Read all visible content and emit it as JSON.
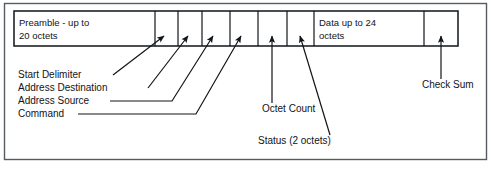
{
  "figure": {
    "background_color": "#ffffff",
    "frame_border_color": "#555b60",
    "line_color": "#111418"
  },
  "frame_bar": {
    "fields": [
      {
        "id": "preamble",
        "label_line1": "Preamble - up to",
        "label_line2": "20 octets",
        "x": 14,
        "width": 141
      },
      {
        "id": "start-delimiter",
        "label_line1": "",
        "label_line2": "",
        "x": 155,
        "width": 23
      },
      {
        "id": "address-destination",
        "label_line1": "",
        "label_line2": "",
        "x": 178,
        "width": 24
      },
      {
        "id": "address-source",
        "label_line1": "",
        "label_line2": "",
        "x": 202,
        "width": 28
      },
      {
        "id": "command",
        "label_line1": "",
        "label_line2": "",
        "x": 230,
        "width": 28
      },
      {
        "id": "octet-count",
        "label_line1": "",
        "label_line2": "",
        "x": 258,
        "width": 29
      },
      {
        "id": "status",
        "label_line1": "",
        "label_line2": "",
        "x": 287,
        "width": 27
      },
      {
        "id": "data",
        "label_line1": "Data up to 24",
        "label_line2": "octets",
        "x": 314,
        "width": 110
      },
      {
        "id": "check-sum",
        "label_line1": "",
        "label_line2": "",
        "x": 424,
        "width": 34
      }
    ]
  },
  "callouts": [
    {
      "id": "start-delimiter",
      "label": "Start Delimiter",
      "text_x": 18,
      "text_y": 78
    },
    {
      "id": "address-destination",
      "label": "Address Destination",
      "text_x": 18,
      "text_y": 91
    },
    {
      "id": "address-source",
      "label": "Address Source",
      "text_x": 18,
      "text_y": 104
    },
    {
      "id": "command",
      "label": "Command",
      "text_x": 18,
      "text_y": 117
    },
    {
      "id": "octet-count",
      "label": "Octet Count",
      "text_x": 262,
      "text_y": 112
    },
    {
      "id": "status",
      "label": "Status (2 octets)",
      "text_x": 258,
      "text_y": 144
    },
    {
      "id": "check-sum",
      "label": "Check Sum",
      "text_x": 422,
      "text_y": 88
    }
  ]
}
